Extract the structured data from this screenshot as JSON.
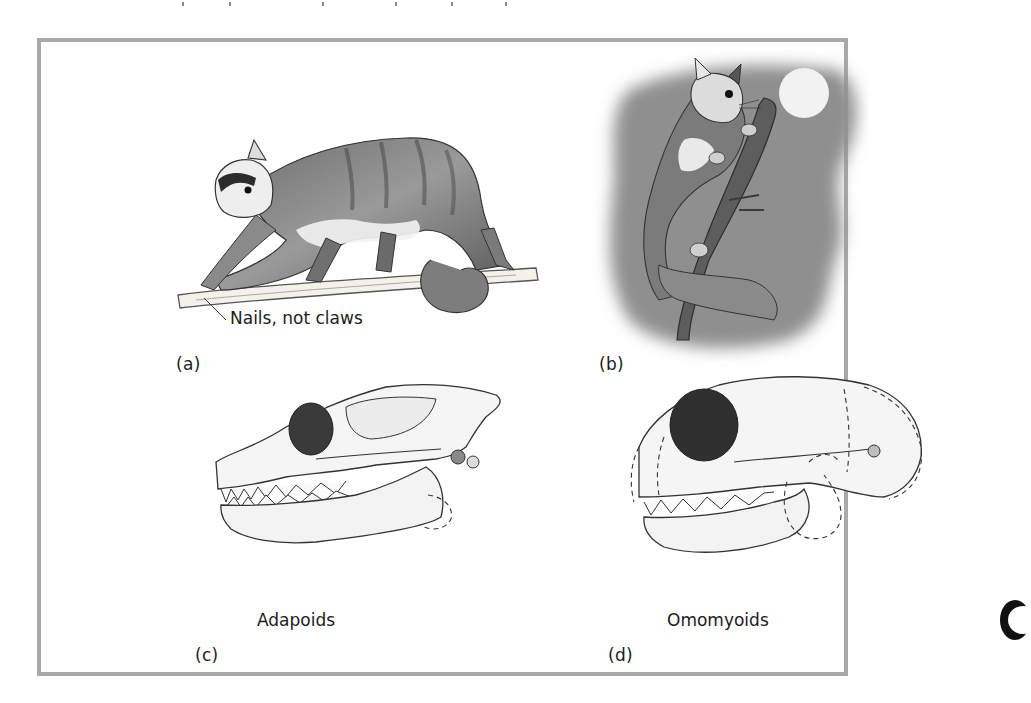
{
  "figure": {
    "border_color": "#a9a9a9",
    "panels": [
      {
        "id": "a",
        "label": "(a)",
        "annotation": "Nails, not claws",
        "subject": "adapoid-like primate walking on branch"
      },
      {
        "id": "b",
        "label": "(b)",
        "subject": "nocturnal omomyoid-like primate clinging to branch under moon"
      },
      {
        "id": "c",
        "label": "(c)",
        "caption": "Adapoids",
        "subject": "adapoid skull"
      },
      {
        "id": "d",
        "label": "(d)",
        "caption": "Omomyoids",
        "subject": "omomyoid skull"
      }
    ],
    "colors": {
      "night_background": "#8f8f8f",
      "moon": "#f2f2f2",
      "ink": "#2a2a2a"
    }
  }
}
